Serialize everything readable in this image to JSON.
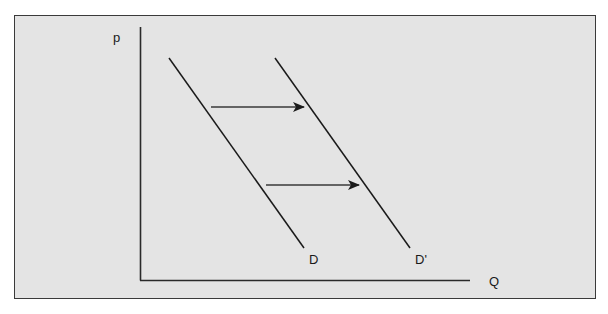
{
  "diagram": {
    "axes": {
      "y_label": "p",
      "x_label": "Q"
    },
    "curves": [
      {
        "name": "D",
        "label": "D"
      },
      {
        "name": "D'",
        "label": "D'"
      }
    ],
    "arrows": [
      {
        "direction": "right",
        "description": "shift from D to D'"
      },
      {
        "direction": "right",
        "description": "shift from D to D'"
      }
    ],
    "colors": {
      "background": "#e4e4e4",
      "line": "#1a1a1a",
      "frame": "#3a3a3a"
    }
  }
}
